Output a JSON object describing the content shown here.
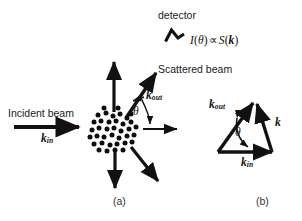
{
  "figure": {
    "background_color": "#ffffff",
    "ink_color": "#111111",
    "panels": [
      {
        "id": "a",
        "caption": "(a)"
      },
      {
        "id": "b",
        "caption": "(b)"
      }
    ]
  },
  "panel_a": {
    "detector_label": "detector",
    "detector_icon": "chevron-detector-icon",
    "intensity_relation": {
      "full": "I(θ) ∝ S(k)",
      "intensity_symbol": "I",
      "open_paren": "(",
      "angle_symbol": "θ",
      "close_paren": ")",
      "proportional_symbol": "∝",
      "structure_factor_symbol": "S",
      "wavevector_symbol": "k"
    },
    "incident_beam_label": "Incident beam",
    "incident_wavevector": {
      "base": "k",
      "sub": "in"
    },
    "scattered_beam_label": "Scattered beam",
    "outgoing_wavevector": {
      "base": "k",
      "sub": "out"
    },
    "scattering_angle": "θ",
    "sample_label": "particle-cluster",
    "sample_particle_count": 38,
    "arrows": [
      {
        "name": "incident-beam-arrow",
        "direction": "right"
      },
      {
        "name": "transmitted-beam-arrow",
        "direction": "right"
      },
      {
        "name": "scattered-beam-arrow-up-right",
        "direction": "up-right"
      },
      {
        "name": "scattered-beam-arrow-up",
        "direction": "up"
      },
      {
        "name": "scattered-beam-arrow-down",
        "direction": "down"
      },
      {
        "name": "scattered-beam-arrow-down-right",
        "direction": "down-right"
      }
    ]
  },
  "panel_b": {
    "title": "wavevector-triangle",
    "vectors": [
      {
        "name": "k-out-vector",
        "base": "k",
        "sub": "out"
      },
      {
        "name": "k-in-vector",
        "base": "k",
        "sub": "in"
      },
      {
        "name": "k-transfer-vector",
        "base": "k",
        "sub": ""
      }
    ],
    "angle_label": "θ"
  }
}
